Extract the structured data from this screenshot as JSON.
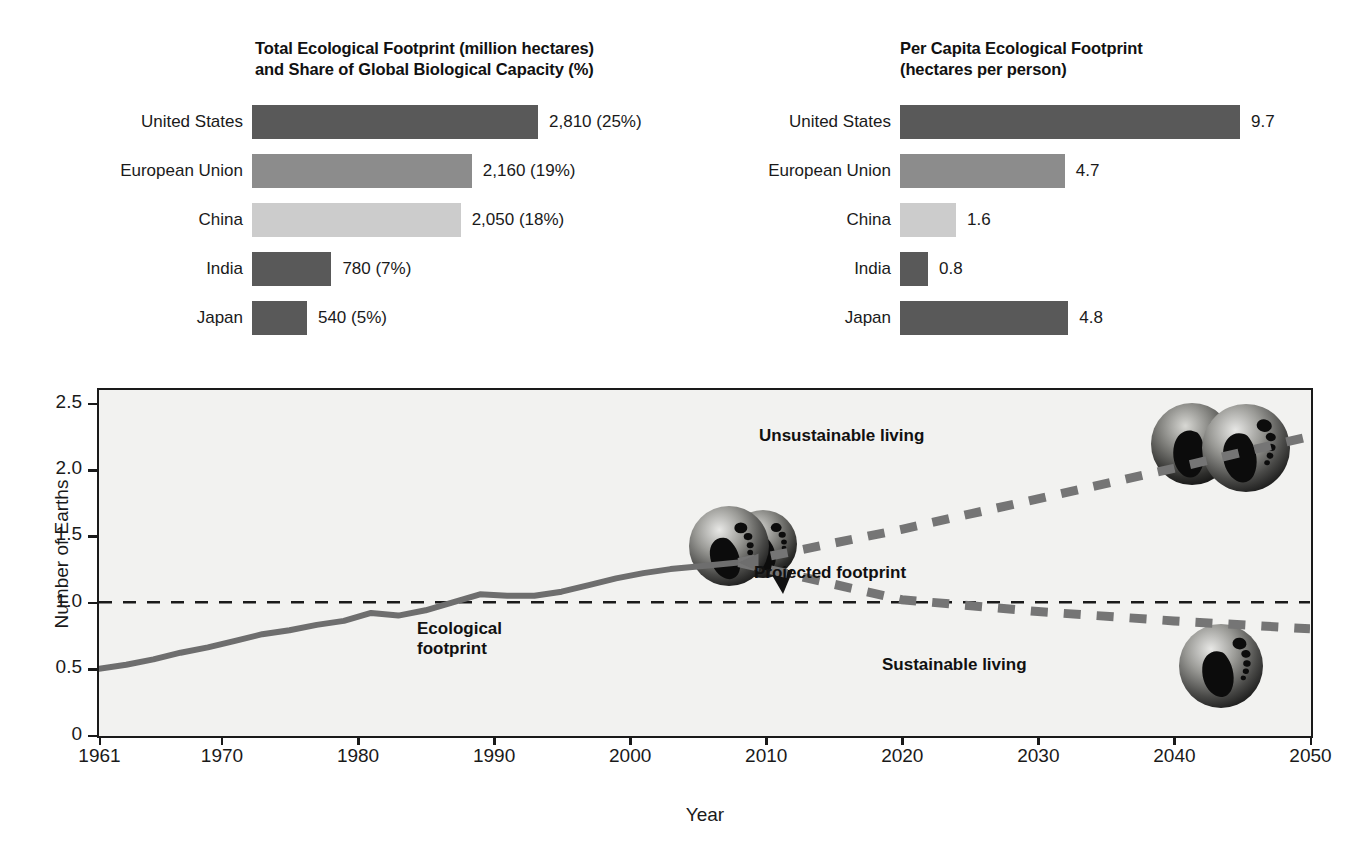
{
  "charts": {
    "total_footprint": {
      "title_line1": "Total Ecological Footprint (million hectares)",
      "title_line2": "and Share of Global Biological Capacity (%)",
      "rows": [
        {
          "label": "United States",
          "value_text": "2,810 (25%)",
          "value": 2810,
          "share_pct": 25,
          "shade": "dark"
        },
        {
          "label": "European Union",
          "value_text": "2,160 (19%)",
          "value": 2160,
          "share_pct": 19,
          "shade": "medium"
        },
        {
          "label": "China",
          "value_text": "2,050 (18%)",
          "value": 2050,
          "share_pct": 18,
          "shade": "light"
        },
        {
          "label": "India",
          "value_text": "780 (7%)",
          "value": 780,
          "share_pct": 7,
          "shade": "dark"
        },
        {
          "label": "Japan",
          "value_text": "540 (5%)",
          "value": 540,
          "share_pct": 5,
          "shade": "dark"
        }
      ]
    },
    "per_capita": {
      "title_line1": "Per Capita Ecological Footprint",
      "title_line2": "(hectares per person)",
      "rows": [
        {
          "label": "United States",
          "value_text": "9.7",
          "value": 9.7,
          "shade": "dark"
        },
        {
          "label": "European Union",
          "value_text": "4.7",
          "value": 4.7,
          "shade": "medium"
        },
        {
          "label": "China",
          "value_text": "1.6",
          "value": 1.6,
          "shade": "light"
        },
        {
          "label": "India",
          "value_text": "0.8",
          "value": 0.8,
          "shade": "dark"
        },
        {
          "label": "Japan",
          "value_text": "4.8",
          "value": 4.8,
          "shade": "dark"
        }
      ]
    }
  },
  "chart_data": {
    "type": "line",
    "title": "",
    "xlabel": "Year",
    "ylabel": "Number of Earths",
    "xlim": [
      1961,
      2050
    ],
    "ylim": [
      0,
      2.6
    ],
    "grid": false,
    "legend_position": "inline-annotations",
    "xticks": [
      1961,
      1970,
      1980,
      1990,
      2000,
      2010,
      2020,
      2030,
      2040,
      2050
    ],
    "xtick_labels": [
      "1961",
      "1970",
      "1980",
      "1990",
      "2000",
      "2010",
      "2020",
      "2030",
      "2040",
      "2050"
    ],
    "yticks": [
      0,
      0.5,
      1.0,
      1.5,
      2.0,
      2.5
    ],
    "ytick_labels": [
      "0",
      "0.5",
      "1.0",
      "1.5",
      "2.0",
      "2.5"
    ],
    "reference_line": {
      "y": 1.0,
      "style": "dashed",
      "label": "one Earth"
    },
    "series": [
      {
        "name": "Ecological footprint",
        "style": "solid",
        "x": [
          1961,
          1963,
          1965,
          1967,
          1969,
          1971,
          1973,
          1975,
          1977,
          1979,
          1981,
          1983,
          1985,
          1987,
          1989,
          1991,
          1993,
          1995,
          1997,
          1999,
          2001,
          2003,
          2005,
          2008
        ],
        "values": [
          0.5,
          0.53,
          0.57,
          0.62,
          0.66,
          0.71,
          0.76,
          0.79,
          0.83,
          0.86,
          0.92,
          0.9,
          0.94,
          1.0,
          1.06,
          1.05,
          1.05,
          1.08,
          1.13,
          1.18,
          1.22,
          1.25,
          1.27,
          1.3
        ]
      },
      {
        "name": "Unsustainable living",
        "style": "dashed-thick",
        "x": [
          2008,
          2020,
          2030,
          2040,
          2050
        ],
        "values": [
          1.3,
          1.55,
          1.78,
          2.01,
          2.25
        ]
      },
      {
        "name": "Sustainable living",
        "style": "dashed-thick",
        "x": [
          2008,
          2020,
          2030,
          2040,
          2050
        ],
        "values": [
          1.3,
          1.02,
          0.93,
          0.86,
          0.8
        ]
      }
    ],
    "annotations": [
      {
        "text": "Unsustainable living",
        "x": 2028,
        "y": 2.25
      },
      {
        "text": "Projected footprint",
        "x": 2010,
        "y": 1.33
      },
      {
        "text": "Ecological\nfootprint",
        "x": 1993,
        "y": 0.8
      },
      {
        "text": "Sustainable living",
        "x": 2030,
        "y": 0.62
      }
    ],
    "images": [
      {
        "name": "two-earths-footprint-globe",
        "x": 2000,
        "y": 1.45
      },
      {
        "name": "two-earths-footprint-globe",
        "x": 2042,
        "y": 2.1
      },
      {
        "name": "one-earth-footprint-globe",
        "x": 2044,
        "y": 0.58
      }
    ]
  },
  "colors": {
    "shade_dark": "#595959",
    "shade_medium": "#8c8c8c",
    "shade_light": "#cccccc",
    "line": "#6e6e6e",
    "axis": "#1a1a1a",
    "plot_background": "#f2f2f0"
  }
}
